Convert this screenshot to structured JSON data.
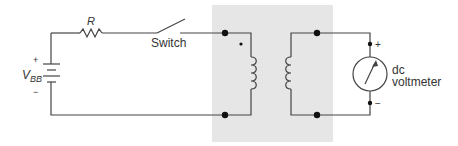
{
  "diagram": {
    "type": "circuit",
    "labels": {
      "resistor": "R",
      "switch": "Switch",
      "source_main": "V",
      "source_sub": "BB",
      "source_plus": "+",
      "source_minus": "−",
      "meter_plus": "+",
      "meter_minus": "−",
      "meter_line1": "dc",
      "meter_line2": "voltmeter"
    },
    "colors": {
      "wire": "#444444",
      "transformer_box": "#e6e6e6",
      "node": "#111111",
      "text": "#333333"
    },
    "components": [
      {
        "id": "dc-source",
        "name": "VBB"
      },
      {
        "id": "resistor",
        "name": "R"
      },
      {
        "id": "switch",
        "name": "Switch"
      },
      {
        "id": "transformer",
        "name": "transformer with dot on primary"
      },
      {
        "id": "voltmeter",
        "name": "dc voltmeter"
      }
    ]
  }
}
